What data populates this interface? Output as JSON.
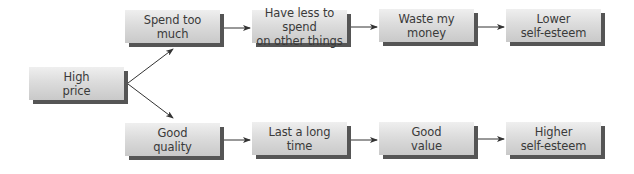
{
  "diagram": {
    "nodes": [
      {
        "id": "high-price",
        "label": "High\nprice",
        "x": 29,
        "y": 67
      },
      {
        "id": "spend-too-much",
        "label": "Spend too\nmuch",
        "x": 125,
        "y": 10
      },
      {
        "id": "have-less",
        "label": "Have less to spend\non other things",
        "x": 252,
        "y": 10
      },
      {
        "id": "waste-money",
        "label": "Waste my\nmoney",
        "x": 379,
        "y": 9
      },
      {
        "id": "lower-self-esteem",
        "label": "Lower\nself-esteem",
        "x": 506,
        "y": 9
      },
      {
        "id": "good-quality",
        "label": "Good\nquality",
        "x": 125,
        "y": 123
      },
      {
        "id": "last-long",
        "label": "Last a long\ntime",
        "x": 252,
        "y": 122
      },
      {
        "id": "good-value",
        "label": "Good\nvalue",
        "x": 379,
        "y": 122
      },
      {
        "id": "higher-self-esteem",
        "label": "Higher\nself-esteem",
        "x": 506,
        "y": 122
      }
    ],
    "edges": [
      {
        "from": "high-price",
        "to": "spend-too-much"
      },
      {
        "from": "high-price",
        "to": "good-quality"
      },
      {
        "from": "spend-too-much",
        "to": "have-less"
      },
      {
        "from": "have-less",
        "to": "waste-money"
      },
      {
        "from": "waste-money",
        "to": "lower-self-esteem"
      },
      {
        "from": "good-quality",
        "to": "last-long"
      },
      {
        "from": "last-long",
        "to": "good-value"
      },
      {
        "from": "good-value",
        "to": "higher-self-esteem"
      }
    ],
    "colors": {
      "node_fill_top": "#efefef",
      "node_fill_bottom": "#c9c9c9",
      "node_shadow": "#555555",
      "text": "#3a3a3a",
      "arrow": "#333333",
      "background": "#ffffff"
    }
  }
}
